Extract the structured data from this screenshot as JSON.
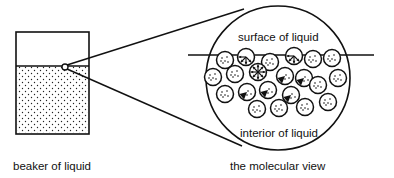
{
  "labels": {
    "beaker": "beaker of liquid",
    "molecular_view": "the molecular view",
    "surface": "surface of liquid",
    "interior": "interior of liquid"
  },
  "colors": {
    "ink": "#111111",
    "background": "#ffffff"
  },
  "beaker": {
    "x": 16,
    "y": 32,
    "w": 73,
    "h": 102,
    "liquid_level_y": 66
  },
  "magnifier_source": {
    "cx": 65,
    "cy": 67,
    "r": 3
  },
  "magnified_circle": {
    "cx": 278,
    "cy": 78,
    "r": 72
  },
  "surface_line": {
    "x1": 188,
    "x2": 374,
    "y": 55
  },
  "molecules": [
    {
      "cx": 225,
      "cy": 60,
      "type": "surface"
    },
    {
      "cx": 246,
      "cy": 57,
      "type": "surface-arrows"
    },
    {
      "cx": 270,
      "cy": 62,
      "type": "surface"
    },
    {
      "cx": 294,
      "cy": 56,
      "type": "surface-arrows"
    },
    {
      "cx": 313,
      "cy": 59,
      "type": "surface"
    },
    {
      "cx": 332,
      "cy": 58,
      "type": "surface"
    },
    {
      "cx": 213,
      "cy": 77,
      "type": "interior"
    },
    {
      "cx": 235,
      "cy": 74,
      "type": "interior"
    },
    {
      "cx": 258,
      "cy": 72,
      "type": "star"
    },
    {
      "cx": 285,
      "cy": 76,
      "type": "arrow-down"
    },
    {
      "cx": 304,
      "cy": 78,
      "type": "arrow-down"
    },
    {
      "cx": 338,
      "cy": 78,
      "type": "interior"
    },
    {
      "cx": 225,
      "cy": 94,
      "type": "interior"
    },
    {
      "cx": 247,
      "cy": 92,
      "type": "arrow-down"
    },
    {
      "cx": 268,
      "cy": 90,
      "type": "arrow-down"
    },
    {
      "cx": 291,
      "cy": 95,
      "type": "arrow-down"
    },
    {
      "cx": 318,
      "cy": 85,
      "type": "interior"
    },
    {
      "cx": 328,
      "cy": 102,
      "type": "interior"
    },
    {
      "cx": 257,
      "cy": 109,
      "type": "interior"
    },
    {
      "cx": 279,
      "cy": 108,
      "type": "interior"
    },
    {
      "cx": 305,
      "cy": 107,
      "type": "interior"
    }
  ]
}
